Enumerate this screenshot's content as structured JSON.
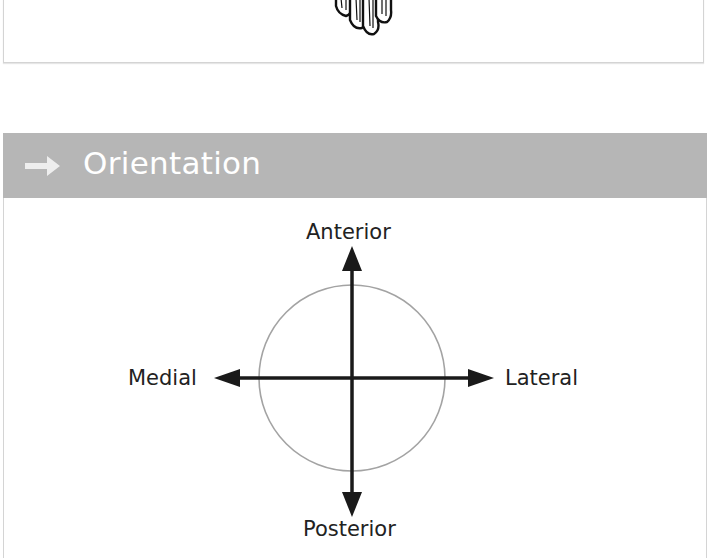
{
  "top_panel": {
    "illustration_icon": "hand-fingertips-illustration"
  },
  "section": {
    "icon": "arrow-right-icon",
    "title": "Orientation",
    "header_color": "#b6b6b6"
  },
  "diagram": {
    "labels": {
      "top": "Anterior",
      "bottom": "Posterior",
      "left": "Medial",
      "right": "Lateral"
    },
    "circle_color": "#9a9a9a",
    "arrow_color": "#1a1a1a"
  }
}
